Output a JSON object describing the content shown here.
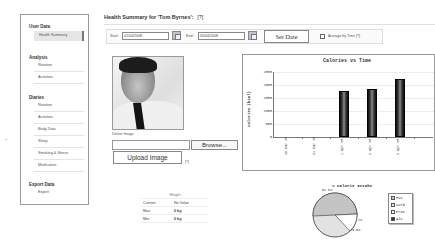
{
  "sidebar": {
    "sections": [
      {
        "title": "User Data",
        "items": [
          {
            "label": "Health Summary",
            "active": true
          }
        ]
      },
      {
        "title": "Analysis",
        "items": [
          {
            "label": "Nutrition"
          },
          {
            "label": "Activities"
          }
        ]
      },
      {
        "title": "Diaries",
        "items": [
          {
            "label": "Nutrition"
          },
          {
            "label": "Activities"
          },
          {
            "label": "Body Data"
          },
          {
            "label": "Sleep"
          },
          {
            "label": "Smoking & Stress"
          },
          {
            "label": "Medication"
          }
        ]
      },
      {
        "title": "Export Data",
        "items": [
          {
            "label": "Export"
          }
        ]
      }
    ]
  },
  "header": {
    "title": "Health Summary for 'Tom Byrnes':",
    "help": "[?]"
  },
  "date_bar": {
    "start_label": "Start:",
    "start_value": "01/04/2008",
    "end_label": "End:",
    "end_value": "05/04/2008",
    "set_date_label": "Set Date",
    "average_label": "Average by Time",
    "average_checked": false,
    "help": "[?]"
  },
  "profile": {
    "delete_image_label": "Delete Image",
    "file_input_value": "",
    "browse_label": "Browse...",
    "upload_label": "Upload Image",
    "help": "[?]"
  },
  "weight_table": {
    "title": "Weight",
    "rows": [
      {
        "label": "Current:",
        "value": "No Value"
      },
      {
        "label": "Max:",
        "value": "0 kg"
      },
      {
        "label": "Min:",
        "value": "0 kg"
      }
    ]
  },
  "chart_data": [
    {
      "type": "bar",
      "title": "Calories vs Time",
      "xlabel": "",
      "ylabel": "Calories (kcal)",
      "categories": [
        "29 Mar 08",
        "31 Mar 08",
        "1 Apr 08",
        "2 Apr 08",
        "3 Apr 08"
      ],
      "values": [
        0,
        0,
        1750,
        1850,
        2240
      ],
      "ylim": [
        0,
        2500
      ],
      "yticks": [
        "2500",
        "2000",
        "1500",
        "1000",
        "500",
        "0"
      ],
      "grid": true
    },
    {
      "type": "pie",
      "title": "% Calorie Intake",
      "categories": [
        "Fat",
        "Carb",
        "Prot.",
        "Alc"
      ],
      "values": [
        52.8,
        33.0,
        6.7,
        0
      ],
      "value_labels": [
        "52.8%",
        "33.0%",
        "6.7%"
      ],
      "legend_position": "right",
      "colors": [
        "#c8c8c8",
        "#e4e4e4",
        "#ffffff",
        "#333333"
      ]
    }
  ]
}
